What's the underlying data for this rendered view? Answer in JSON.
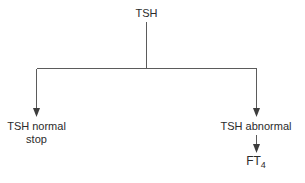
{
  "diagram": {
    "title": "TSH",
    "background_color": "#ffffff",
    "line_color": "#5b5b5b",
    "text_color": "#2b2b2b",
    "nodes": {
      "root": {
        "label": "TSH"
      },
      "normal": {
        "label_line1": "TSH normal",
        "label_line2": "stop"
      },
      "abnormal": {
        "label": "TSH abnormal"
      },
      "ft4": {
        "label_base": "FT",
        "label_subscript": "4"
      }
    },
    "edges": [
      {
        "name": "root-to-bus",
        "from": "TSH",
        "to": "branch-bus",
        "arrow": false
      },
      {
        "name": "bus-to-normal",
        "from": "branch-bus",
        "to": "TSH normal stop",
        "arrow": true
      },
      {
        "name": "bus-to-abnormal",
        "from": "branch-bus",
        "to": "TSH abnormal",
        "arrow": true
      },
      {
        "name": "abnormal-to-ft4",
        "from": "TSH abnormal",
        "to": "FT4",
        "arrow": true
      }
    ]
  }
}
